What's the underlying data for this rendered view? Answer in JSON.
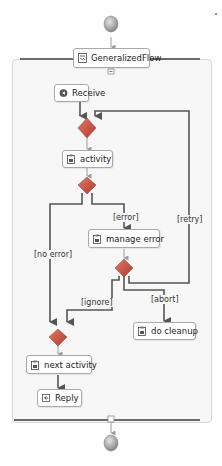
{
  "diagram": {
    "title": "GeneralizedFlow",
    "start_node": {
      "icon": "start-event-icon"
    },
    "end_node": {
      "icon": "end-event-icon"
    },
    "activities": [
      {
        "id": "receive",
        "label": "Receive",
        "icon": "receive-icon"
      },
      {
        "id": "activity",
        "label": "activity",
        "icon": "activity-icon"
      },
      {
        "id": "manage_error",
        "label": "manage error",
        "icon": "activity-icon"
      },
      {
        "id": "do_cleanup",
        "label": "do cleanup",
        "icon": "activity-icon"
      },
      {
        "id": "next_activity",
        "label": "next activity",
        "icon": "activity-icon"
      },
      {
        "id": "reply",
        "label": "Reply",
        "icon": "reply-icon"
      }
    ],
    "gateways": [
      "merge-1",
      "decision-1",
      "decision-2",
      "merge-2"
    ],
    "edge_labels": {
      "error": "[error]",
      "no_error": "[no error]",
      "retry": "[retry]",
      "ignore": "[ignore]",
      "abort": "[abort]"
    },
    "colors": {
      "gateway": "#c94a3a",
      "line": "#555555",
      "connector": "#9a9a9a",
      "container_bg": "#f7f7f7"
    }
  }
}
